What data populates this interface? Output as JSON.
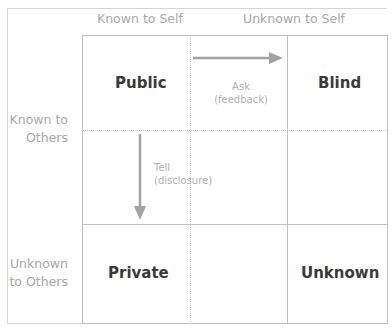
{
  "columns": {
    "known_to_self": "Known to Self",
    "unknown_to_self": "Unknown to Self"
  },
  "rows": {
    "known_to_others_line1": "Known to",
    "known_to_others_line2": "Others",
    "unknown_to_others_line1": "Unknown",
    "unknown_to_others_line2": "to Others"
  },
  "quadrants": {
    "public": "Public",
    "blind": "Blind",
    "private": "Private",
    "unknown": "Unknown"
  },
  "arrows": {
    "ask_line1": "Ask",
    "ask_line2": "(feedback)",
    "tell_line1": "Tell",
    "tell_line2": "(disclosure)"
  },
  "colors": {
    "label_gray": "#a8a8a8",
    "quadrant_text": "#3a3a3a",
    "arrow_gray": "#9e9e9e"
  }
}
